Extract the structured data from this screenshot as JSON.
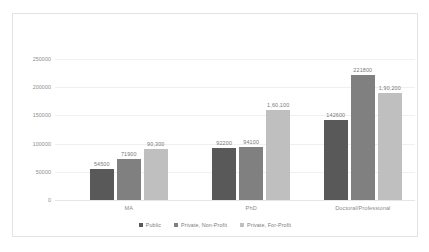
{
  "chart_data": {
    "type": "bar",
    "title": "",
    "subtitle": "",
    "xlabel": "",
    "ylabel": "",
    "categories": [
      "MA",
      "PhD",
      "Doctoral/Professional"
    ],
    "series": [
      {
        "name": "Public",
        "color": "#595959",
        "values": [
          54500,
          92200,
          142600
        ],
        "labels": [
          "54500",
          "92200",
          "142600"
        ]
      },
      {
        "name": "Private, Non-Profit",
        "color": "#808080",
        "values": [
          71900,
          94100,
          221800
        ],
        "labels": [
          "71900",
          "94100",
          "221800"
        ]
      },
      {
        "name": "Private, For-Profit",
        "color": "#bfbfbf",
        "values": [
          90300,
          160100,
          190200
        ],
        "labels": [
          "90,300",
          "1,60,100",
          "1,90,200"
        ]
      }
    ],
    "ylim": [
      0,
      250000
    ],
    "yticks": [
      0,
      50000,
      100000,
      150000,
      200000,
      250000
    ],
    "ytick_labels": [
      "0",
      "50000",
      "100000",
      "150000",
      "200000",
      "250000"
    ],
    "grid": true,
    "legend_position": "bottom",
    "data_labels": true
  },
  "legend": {
    "items": [
      {
        "label": "Public",
        "color": "#595959"
      },
      {
        "label": "Private, Non-Profit",
        "color": "#808080"
      },
      {
        "label": "Private, For-Profit",
        "color": "#bfbfbf"
      }
    ]
  },
  "colors": {
    "public": "#595959",
    "private_non_profit": "#808080",
    "private_for_profit": "#bfbfbf",
    "gridline": "#f0f0f0",
    "axis_text": "#8c8c8c",
    "border": "#e3e3e3"
  }
}
